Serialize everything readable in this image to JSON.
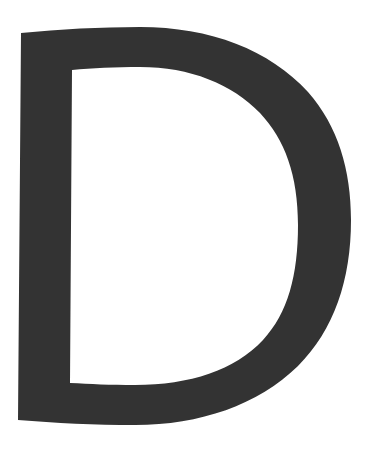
{
  "glyph": {
    "character": "D",
    "fill_color": "#333333",
    "background_color": "#ffffff"
  }
}
